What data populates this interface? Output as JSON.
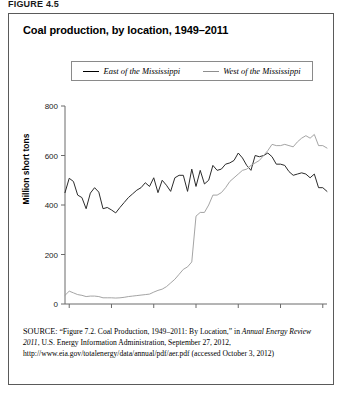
{
  "figure_number": "FIGURE 4.5",
  "title": "Coal production, by location, 1949–2011",
  "legend": {
    "east_label": "East of the Mississippi",
    "west_label": "West of the Mississippi"
  },
  "source": {
    "prefix": "SOURCE:",
    "part1": " “Figure 7.2. Coal Production, 1949–2011: By Location,” in ",
    "italic": "Annual Energy Review 2011",
    "part2": ", U.S. Energy Information Administration, September 27, 2012, http://www.eia.gov/totalenergy/data/annual/pdf/aer.pdf (accessed October 3, 2012)"
  },
  "colors": {
    "east": "#2b2b2b",
    "west": "#9a9a9a",
    "axis": "#6b6b6b",
    "frame": "#5a5a5a"
  },
  "chart_data": {
    "type": "line",
    "title": "Coal production, by location, 1949–2011",
    "xlabel": "",
    "ylabel": "Million short tons",
    "xlim": [
      1949,
      2011
    ],
    "ylim": [
      0,
      800
    ],
    "yticks": [
      0,
      200,
      400,
      600,
      800
    ],
    "xticks": [
      1950,
      1960,
      1970,
      1980,
      1990,
      2000,
      2010
    ],
    "grid": false,
    "legend_position": "top",
    "x": [
      1949,
      1950,
      1951,
      1952,
      1953,
      1954,
      1955,
      1956,
      1957,
      1958,
      1959,
      1960,
      1961,
      1962,
      1963,
      1964,
      1965,
      1966,
      1967,
      1968,
      1969,
      1970,
      1971,
      1972,
      1973,
      1974,
      1975,
      1976,
      1977,
      1978,
      1979,
      1980,
      1981,
      1982,
      1983,
      1984,
      1985,
      1986,
      1987,
      1988,
      1989,
      1990,
      1991,
      1992,
      1993,
      1994,
      1995,
      1996,
      1997,
      1998,
      1999,
      2000,
      2001,
      2002,
      2003,
      2004,
      2005,
      2006,
      2007,
      2008,
      2009,
      2010,
      2011
    ],
    "series": [
      {
        "name": "East of the Mississippi",
        "color": "#2b2b2b",
        "values": [
          450,
          508,
          495,
          440,
          430,
          385,
          448,
          470,
          452,
          385,
          390,
          380,
          368,
          390,
          410,
          430,
          445,
          460,
          470,
          490,
          475,
          510,
          450,
          500,
          480,
          455,
          510,
          520,
          520,
          455,
          545,
          475,
          540,
          485,
          500,
          560,
          540,
          545,
          565,
          570,
          580,
          610,
          590,
          560,
          540,
          600,
          595,
          600,
          610,
          595,
          565,
          565,
          560,
          535,
          520,
          525,
          530,
          525,
          510,
          525,
          470,
          470,
          455
        ]
      },
      {
        "name": "West of the Mississippi",
        "color": "#9a9a9a",
        "values": [
          35,
          52,
          45,
          38,
          35,
          30,
          32,
          32,
          30,
          25,
          25,
          25,
          24,
          25,
          27,
          30,
          32,
          34,
          36,
          38,
          40,
          48,
          55,
          60,
          70,
          85,
          100,
          120,
          140,
          150,
          170,
          355,
          370,
          370,
          400,
          440,
          440,
          450,
          470,
          495,
          510,
          525,
          540,
          545,
          560,
          570,
          580,
          600,
          620,
          645,
          640,
          640,
          645,
          640,
          635,
          655,
          670,
          680,
          670,
          685,
          640,
          640,
          630
        ]
      }
    ]
  }
}
